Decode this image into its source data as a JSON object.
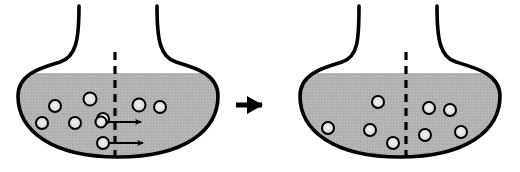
{
  "figure": {
    "width": 520,
    "height": 172,
    "background_color": "#ffffff",
    "outline_color": "#000000",
    "liquid_color": "#b0b0b0",
    "particle_fill_color": "#d8d8d8",
    "particle_outline_color": "#000000",
    "barrier_color": "#000000",
    "arrow_color": "#000000"
  },
  "panels": [
    {
      "id": "before",
      "label": "before-diffusion",
      "flask": {
        "left": 18,
        "right": 218,
        "liquid_top": 73,
        "bottom": 157,
        "neck_left_x": 79,
        "neck_right_x": 157,
        "neck_top_y": 6
      },
      "barrier": {
        "x": 115,
        "top": 52,
        "bottom": 157,
        "dash": "8 6",
        "width": 3.2
      },
      "particles_left_of_barrier": [
        {
          "cx": 55,
          "cy": 106,
          "r": 6
        },
        {
          "cx": 42,
          "cy": 123,
          "r": 6
        },
        {
          "cx": 90,
          "cy": 99,
          "r": 6.5
        },
        {
          "cx": 75,
          "cy": 123,
          "r": 6
        },
        {
          "cx": 103,
          "cy": 119,
          "r": 6
        },
        {
          "cx": 101,
          "cy": 122,
          "r": 5.5
        },
        {
          "cx": 103,
          "cy": 143,
          "r": 6
        }
      ],
      "particles_right_of_barrier": [
        {
          "cx": 139,
          "cy": 105,
          "r": 6.5
        },
        {
          "cx": 160,
          "cy": 107,
          "r": 6
        }
      ],
      "flow_arrows": [
        {
          "x1": 108,
          "y1": 122,
          "x2": 143,
          "y2": 122
        },
        {
          "x1": 110,
          "y1": 143,
          "x2": 145,
          "y2": 143
        }
      ]
    },
    {
      "id": "after",
      "label": "after-diffusion",
      "flask": {
        "left": 300,
        "right": 500,
        "liquid_top": 73,
        "bottom": 157,
        "neck_left_x": 359,
        "neck_right_x": 437,
        "neck_top_y": 6
      },
      "barrier": {
        "x": 406,
        "top": 52,
        "bottom": 157,
        "dash": "8 6",
        "width": 3.2
      },
      "particles_left_of_barrier": [
        {
          "cx": 378,
          "cy": 102,
          "r": 6
        },
        {
          "cx": 328,
          "cy": 128,
          "r": 6
        },
        {
          "cx": 370,
          "cy": 130,
          "r": 6
        },
        {
          "cx": 393,
          "cy": 143,
          "r": 6
        }
      ],
      "particles_right_of_barrier": [
        {
          "cx": 429,
          "cy": 108,
          "r": 6
        },
        {
          "cx": 450,
          "cy": 110,
          "r": 6
        },
        {
          "cx": 425,
          "cy": 135,
          "r": 6
        },
        {
          "cx": 461,
          "cy": 132,
          "r": 6
        }
      ],
      "flow_arrows": []
    }
  ],
  "transition_arrow": {
    "label": "transition-arrow",
    "x1": 236,
    "y1": 105,
    "x2": 272,
    "y2": 105
  }
}
